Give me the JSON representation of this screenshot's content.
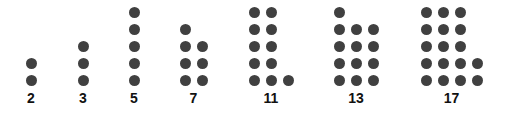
{
  "diagram": {
    "title": "",
    "dot_color": "#404040",
    "label_color": "#111111",
    "groups": [
      {
        "label": "2",
        "count": 2,
        "columns": [
          2
        ],
        "x": 31
      },
      {
        "label": "3",
        "count": 3,
        "columns": [
          3
        ],
        "x": 83
      },
      {
        "label": "5",
        "count": 5,
        "columns": [
          5
        ],
        "x": 134
      },
      {
        "label": "7",
        "count": 7,
        "columns": [
          4,
          3
        ],
        "x": 185
      },
      {
        "label": "11",
        "count": 11,
        "columns": [
          5,
          5,
          1
        ],
        "x": 254
      },
      {
        "label": "13",
        "count": 13,
        "columns": [
          5,
          4,
          4
        ],
        "x": 339
      },
      {
        "label": "17",
        "count": 17,
        "columns": [
          5,
          5,
          5,
          2
        ],
        "x": 426
      }
    ]
  }
}
